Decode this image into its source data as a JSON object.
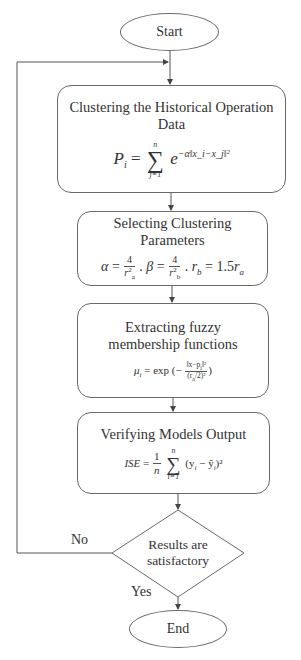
{
  "flowchart": {
    "start": {
      "label": "Start"
    },
    "steps": [
      {
        "title": "Clustering the Historical Operation Data",
        "formula": {
          "lhs": "P",
          "lhs_sub": "i",
          "eq": "=",
          "sum_upper": "n",
          "sum_lower": "j=1",
          "sum_symbol": "∑",
          "base": "e",
          "exponent": "−α‖x_i−x_j‖²",
          "text": "P_i = Σ_{j=1}^{n} e^{−α‖x_i − x_j‖²}"
        }
      },
      {
        "title": "Selecting Clustering Parameters",
        "formula": {
          "alpha": "α",
          "beta": "β",
          "num": "4",
          "den_a": "r",
          "den_a_sub": "a",
          "den_b_sub": "b",
          "sq": "2",
          "rb": "r",
          "rb_sub": "b",
          "rb_val": "= 1.5",
          "ra": "r",
          "ra_sub": "a",
          "eq": "=",
          "sep": ".",
          "text": "α = 4/r_a² . β = 4/r_b² . r_b = 1.5 r_a"
        }
      },
      {
        "title": "Extracting fuzzy membership functions",
        "formula": {
          "lhs": "μ",
          "lhs_sub": "i",
          "rhs_prefix": "= exp (−",
          "numerator": "‖x−p",
          "numerator_sub": "i",
          "numerator_end": "‖²",
          "denominator": "(r",
          "denominator_sub": "a",
          "denominator_end": "/2)²",
          "rhs_suffix": ")",
          "text": "μ_i = exp(−‖x − p_i‖² / (r_a/2)²)"
        }
      },
      {
        "title": "Verifying Models Output",
        "formula": {
          "lhs": "ISE",
          "eq": "=",
          "frac_num": "1",
          "frac_den": "n",
          "sum_upper": "n",
          "sum_lower": "i=1",
          "sum_symbol": "∑",
          "body": "(y",
          "body_sub": "i",
          "body_mid": " − ŷ",
          "body_sub2": "i",
          "body_end": ")²",
          "text": "ISE = (1/n) Σ_{i=1}^{n} (y_i − ŷ_i)²"
        }
      }
    ],
    "decision": {
      "line1": "Results are",
      "line2": "satisfactory"
    },
    "branches": {
      "no": "No",
      "yes": "Yes"
    },
    "end": {
      "label": "End"
    }
  },
  "colors": {
    "stroke": "#6a6a6a",
    "text": "#333333",
    "background": "#ffffff"
  }
}
